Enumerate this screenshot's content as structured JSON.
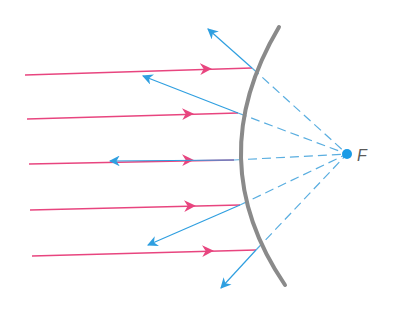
{
  "diagram": {
    "type": "convex-mirror-ray-diagram",
    "colors": {
      "incident": "#e8457f",
      "reflected": "#2f9fe0",
      "extension": "#5aaee0",
      "mirror": "#8a8a8a",
      "focus": "#1a9be6",
      "label": "#5a5a5a"
    },
    "focus": {
      "label": "F",
      "x": 347,
      "y": 154
    },
    "mirror": {
      "top": [
        279,
        27
      ],
      "mid": [
        234,
        160
      ],
      "bottom": [
        285,
        285
      ]
    },
    "rays": [
      {
        "start": [
          25,
          75
        ],
        "hit": [
          252,
          68
        ],
        "arrow": [
          206,
          69
        ],
        "reflect_tip": [
          208,
          29
        ]
      },
      {
        "start": [
          27,
          119
        ],
        "hit": [
          238,
          113
        ],
        "arrow": [
          188,
          114
        ],
        "reflect_tip": [
          143,
          76
        ]
      },
      {
        "start": [
          29,
          164
        ],
        "hit": [
          234,
          160
        ],
        "arrow": [
          188,
          160
        ],
        "reflect_tip": [
          110,
          161
        ]
      },
      {
        "start": [
          30,
          210
        ],
        "hit": [
          240,
          205
        ],
        "arrow": [
          190,
          206
        ],
        "reflect_tip": [
          148,
          245
        ]
      },
      {
        "start": [
          32,
          256
        ],
        "hit": [
          256,
          250
        ],
        "arrow": [
          208,
          251
        ],
        "reflect_tip": [
          221,
          288
        ]
      }
    ]
  }
}
